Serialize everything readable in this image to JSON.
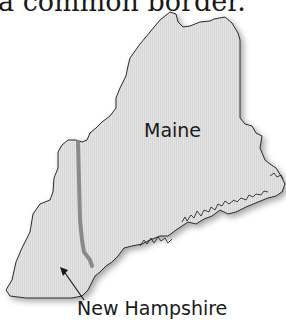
{
  "caption": "a common border.",
  "map": {
    "labels": {
      "maine": "Maine",
      "new_hampshire": "New Hampshire"
    },
    "colors": {
      "land_fill": "#e2e2e2",
      "outline": "#2a2a2a",
      "border_line": "#8a8a8a",
      "shadow": "#bdbdbd"
    }
  }
}
